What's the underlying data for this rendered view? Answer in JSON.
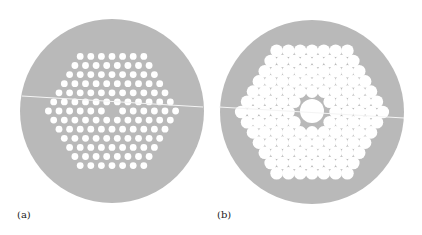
{
  "figure": {
    "panels": [
      {
        "id": "a",
        "label": "(a)",
        "description": "Solid-core photonic crystal fiber cross-section: hexagonal lattice of small air holes with one missing central hole",
        "cladding_color": "#b9b9b9",
        "hole_color": "#ffffff",
        "center": [
          112,
          111
        ],
        "radius": 92,
        "lattice": {
          "rows": [
            7,
            8,
            9,
            10,
            11,
            12,
            13,
            12,
            11,
            10,
            9,
            8,
            7
          ],
          "pitch_x": 10.6,
          "pitch_y": 9.1,
          "hole_radius": 3.4,
          "missing": [
            [
              6,
              6
            ]
          ]
        },
        "scratch_line": {
          "from": [
            22,
            96
          ],
          "to": [
            203,
            107
          ]
        }
      },
      {
        "id": "b",
        "label": "(b)",
        "description": "Hollow-core photonic bandgap fiber cross-section: hexagonal stack of large air holes with an enlarged central hollow core",
        "cladding_color": "#b9b9b9",
        "hole_color": "#ffffff",
        "center": [
          312,
          112
        ],
        "radius": 92,
        "lattice": {
          "rows": [
            7,
            8,
            9,
            10,
            11,
            12,
            13,
            12,
            11,
            10,
            9,
            8,
            7
          ],
          "pitch_x": 11.8,
          "pitch_y": 10.2,
          "hole_radius": 6.3,
          "missing": [
            [
              5,
              5
            ],
            [
              5,
              6
            ],
            [
              6,
              5
            ],
            [
              6,
              6
            ],
            [
              6,
              7
            ],
            [
              7,
              5
            ],
            [
              7,
              6
            ]
          ]
        },
        "core_radius": 12,
        "scratch_line": {
          "from": [
            219,
            107
          ],
          "to": [
            404,
            118
          ]
        }
      }
    ]
  }
}
